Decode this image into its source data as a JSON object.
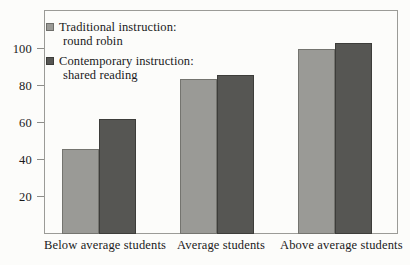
{
  "chart_data": {
    "type": "bar",
    "title": "",
    "xlabel": "",
    "ylabel": "",
    "categories": [
      "Below average students",
      "Average students",
      "Above average students"
    ],
    "series": [
      {
        "name": "Traditional instruction: round robin",
        "name_line1": "Traditional instruction:",
        "name_line2": "round robin",
        "color": "#9a9a96",
        "values": [
          46,
          84,
          100
        ]
      },
      {
        "name": "Contemporary instruction: shared reading",
        "name_line1": "Contemporary instruction:",
        "name_line2": "shared reading",
        "color": "#565653",
        "values": [
          62,
          86,
          103
        ]
      }
    ],
    "yticks": [
      20,
      40,
      60,
      80,
      100
    ],
    "ytick_labels": [
      "20",
      "40",
      "60",
      "80",
      "100"
    ],
    "ylim": [
      0,
      121
    ],
    "grid": false,
    "legend_position": "top-left"
  }
}
